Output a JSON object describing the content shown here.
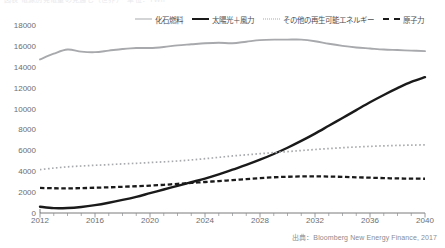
{
  "top_sliver_text": "図表 電源別発電量の見通し（世界）　単位：TWh",
  "legend": {
    "position": "top",
    "items": [
      {
        "label": "化石燃料",
        "style": "solid",
        "color": "#a7a9ac",
        "name": "fossil-fuel"
      },
      {
        "label": "太陽光＋風力",
        "style": "solid",
        "color": "#1a1a1a",
        "name": "solar-wind"
      },
      {
        "label": "その他の再生可能エネルギー",
        "style": "dotted",
        "color": "#a7a9ac",
        "name": "other-renewables"
      },
      {
        "label": "原子力",
        "style": "dashed",
        "color": "#1a1a1a",
        "name": "nuclear"
      }
    ]
  },
  "source_note": "出典：Bloomberg New Energy Finance, 2017",
  "chart_data": {
    "type": "line",
    "title": "",
    "subtitle": "",
    "xlabel": "",
    "ylabel": "",
    "xlim": [
      2012,
      2040
    ],
    "ylim": [
      0,
      18000
    ],
    "grid": false,
    "y_ticks": [
      0,
      2000,
      4000,
      6000,
      8000,
      10000,
      12000,
      14000,
      16000,
      18000
    ],
    "x_ticks": [
      2012,
      2016,
      2020,
      2024,
      2028,
      2032,
      2036,
      2040
    ],
    "x_minor_tick_step": 1,
    "legend_position": "top",
    "x": [
      2012,
      2013,
      2014,
      2015,
      2016,
      2017,
      2018,
      2019,
      2020,
      2021,
      2022,
      2023,
      2024,
      2025,
      2026,
      2027,
      2028,
      2029,
      2030,
      2031,
      2032,
      2033,
      2034,
      2035,
      2036,
      2037,
      2038,
      2039,
      2040
    ],
    "series": [
      {
        "name": "化石燃料",
        "style": "solid",
        "color": "#a7a9ac",
        "values": [
          14700,
          15250,
          15650,
          15450,
          15400,
          15550,
          15700,
          15800,
          15800,
          15900,
          16050,
          16150,
          16250,
          16300,
          16250,
          16400,
          16550,
          16600,
          16600,
          16600,
          16450,
          16200,
          16000,
          15850,
          15750,
          15650,
          15600,
          15550,
          15500
        ]
      },
      {
        "name": "太陽光＋風力",
        "style": "solid",
        "color": "#1a1a1a",
        "values": [
          600,
          470,
          480,
          580,
          750,
          980,
          1250,
          1550,
          1900,
          2250,
          2600,
          2950,
          3300,
          3700,
          4150,
          4600,
          5100,
          5650,
          6250,
          6900,
          7600,
          8350,
          9100,
          9850,
          10600,
          11300,
          11950,
          12550,
          13000
        ]
      },
      {
        "name": "その他の再生可能エネルギー",
        "style": "dotted",
        "color": "#a7a9ac",
        "values": [
          4150,
          4300,
          4420,
          4500,
          4570,
          4630,
          4700,
          4760,
          4830,
          4900,
          4980,
          5080,
          5200,
          5330,
          5460,
          5570,
          5680,
          5780,
          5880,
          5980,
          6080,
          6170,
          6250,
          6320,
          6380,
          6430,
          6470,
          6500,
          6520
        ]
      },
      {
        "name": "原子力",
        "style": "dashed",
        "color": "#1a1a1a",
        "values": [
          2400,
          2370,
          2360,
          2380,
          2420,
          2460,
          2510,
          2560,
          2620,
          2700,
          2790,
          2880,
          2970,
          3060,
          3150,
          3250,
          3340,
          3420,
          3470,
          3500,
          3510,
          3490,
          3460,
          3420,
          3380,
          3340,
          3310,
          3290,
          3280
        ]
      }
    ]
  }
}
